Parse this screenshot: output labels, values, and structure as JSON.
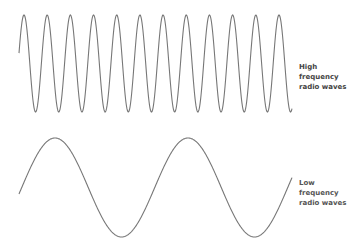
{
  "diagram": {
    "stroke_color": "#777777",
    "waves": [
      {
        "id": "high",
        "label_lines": [
          "High",
          "frequency",
          "radio waves"
        ],
        "visible_peaks": 12,
        "relative_frequency": "high"
      },
      {
        "id": "low",
        "label_lines": [
          "Low",
          "frequency",
          "radio waves"
        ],
        "visible_peaks": 2,
        "relative_frequency": "low"
      }
    ]
  }
}
